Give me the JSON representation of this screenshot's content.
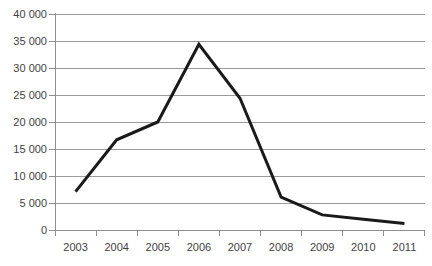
{
  "chart_data": {
    "type": "line",
    "title": "",
    "subtitle": "",
    "xlabel": "",
    "ylabel": "",
    "categories": [
      "2003",
      "2004",
      "2005",
      "2006",
      "2007",
      "2008",
      "2009",
      "2010",
      "2011"
    ],
    "values": [
      7100,
      16700,
      20000,
      34400,
      24400,
      6100,
      2800,
      2000,
      1200
    ],
    "series": [
      {
        "name": "",
        "values": [
          7100,
          16700,
          20000,
          34400,
          24400,
          6100,
          2800,
          2000,
          1200
        ]
      }
    ],
    "ylim": [
      0,
      40000
    ],
    "y_ticks": [
      0,
      5000,
      10000,
      15000,
      20000,
      25000,
      30000,
      35000,
      40000
    ],
    "y_tick_labels": [
      "0",
      "5 000",
      "10 000",
      "15 000",
      "20 000",
      "25 000",
      "30 000",
      "35 000",
      "40 000"
    ],
    "grid": true,
    "grid_axis": "y",
    "legend": false,
    "legend_position": "none",
    "colors": {
      "line": "#1a1a1a",
      "grid": "#9a9a9a",
      "axis": "#8e8e8e",
      "text": "#3f3f3f",
      "background": "#ffffff"
    },
    "line_width": 3,
    "markers": false
  }
}
